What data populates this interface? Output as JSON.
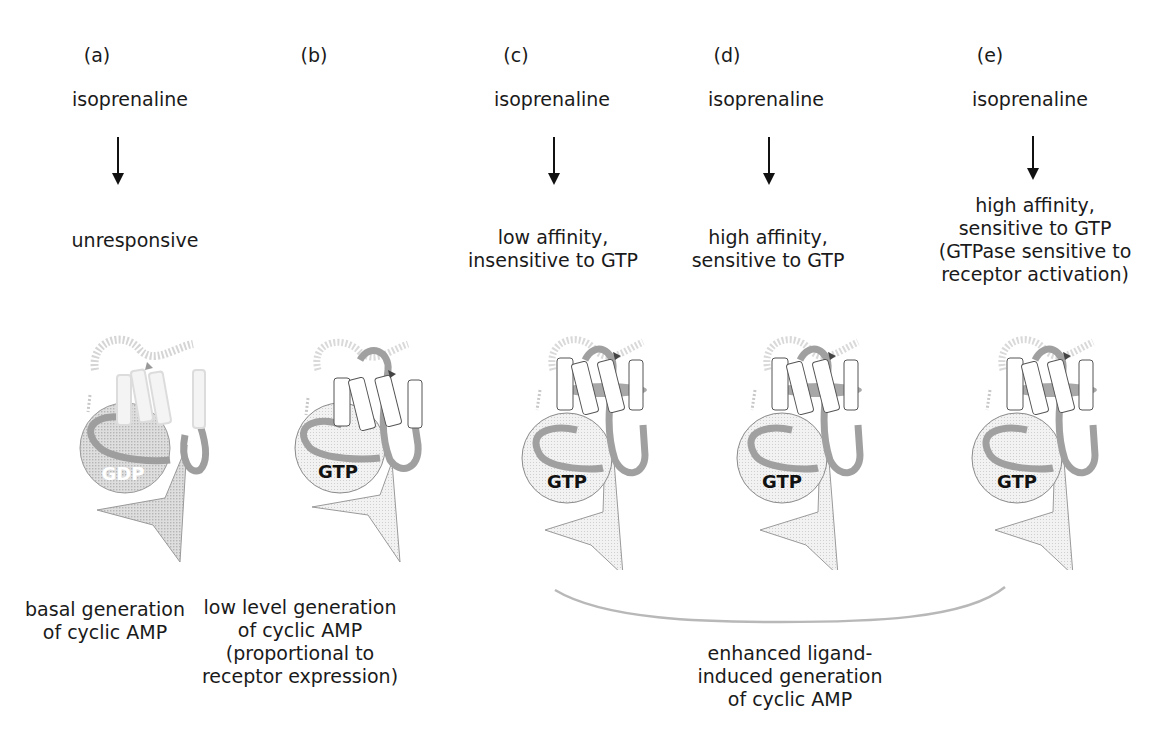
{
  "panels": [
    {
      "id": "a",
      "label": "(a)",
      "agonist": "isoprenaline",
      "state_lines": [
        "unresponsive"
      ],
      "nucleotide": "GDP",
      "receptor_style": "faded",
      "output_lines": [
        "basal generation",
        "of cyclic AMP"
      ]
    },
    {
      "id": "b",
      "label": "(b)",
      "agonist": "",
      "state_lines": [],
      "nucleotide": "GTP",
      "receptor_style": "inactive",
      "output_lines": [
        "low level generation",
        "of cyclic AMP",
        "(proportional to",
        "receptor expression)"
      ]
    },
    {
      "id": "c",
      "label": "(c)",
      "agonist": "isoprenaline",
      "state_lines": [
        "low affinity,",
        "insensitive to GTP"
      ],
      "nucleotide": "GTP",
      "receptor_style": "active"
    },
    {
      "id": "d",
      "label": "(d)",
      "agonist": "isoprenaline",
      "state_lines": [
        "high affinity,",
        "sensitive to GTP"
      ],
      "nucleotide": "GTP",
      "receptor_style": "active"
    },
    {
      "id": "e",
      "label": "(e)",
      "agonist": "isoprenaline",
      "state_lines": [
        "high  affinity,",
        "sensitive to GTP",
        "(GTPase sensitive to",
        "receptor activation)"
      ],
      "nucleotide": "GTP",
      "receptor_style": "active"
    }
  ],
  "grouped_output": {
    "applies_to": [
      "c",
      "d",
      "e"
    ],
    "lines": [
      "enhanced ligand-",
      "induced generation",
      "of cyclic AMP"
    ]
  },
  "colors": {
    "text": "#1a1a1a",
    "loop": "#9a9a9a",
    "helix_fill": "#ffffff",
    "helix_stroke": "#555555",
    "g_protein_fill": "#ececec",
    "bracket": "#b8b8b8"
  }
}
